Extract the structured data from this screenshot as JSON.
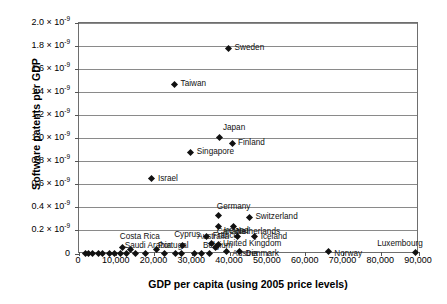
{
  "chart_data": {
    "type": "scatter",
    "title": "",
    "xlabel": "GDP per capita (using 2005 price levels)",
    "ylabel": "Software patents per GDP",
    "xlim": [
      0,
      90000
    ],
    "ylim": [
      0,
      2e-09
    ],
    "grid": true,
    "legend": "none",
    "xticks": [
      0,
      10000,
      20000,
      30000,
      40000,
      50000,
      60000,
      70000,
      80000,
      90000
    ],
    "xtick_labels": [
      "0",
      "10,000",
      "20,000",
      "30,000",
      "40,000",
      "50,000",
      "60,000",
      "70,000",
      "80,000",
      "90,000"
    ],
    "yticks": [
      0,
      2e-10,
      4e-10,
      6e-10,
      8e-10,
      1e-09,
      1.2e-09,
      1.4e-09,
      1.6e-09,
      1.8e-09,
      2e-09
    ],
    "ytick_labels": [
      {
        "mantissa": "0",
        "exponent": ""
      },
      {
        "mantissa": "0.2 × 10",
        "exponent": "-9"
      },
      {
        "mantissa": "0.4 × 10",
        "exponent": "-9"
      },
      {
        "mantissa": "0.6 × 10",
        "exponent": "-9"
      },
      {
        "mantissa": "0.8 × 10",
        "exponent": "-9"
      },
      {
        "mantissa": "1.0 × 10",
        "exponent": "-9"
      },
      {
        "mantissa": "1.2 × 10",
        "exponent": "-9"
      },
      {
        "mantissa": "1.4 × 10",
        "exponent": "-9"
      },
      {
        "mantissa": "1.6 × 10",
        "exponent": "-9"
      },
      {
        "mantissa": "1.8 × 10",
        "exponent": "-9"
      },
      {
        "mantissa": "2.0 × 10",
        "exponent": "-9"
      }
    ],
    "marker": "diamond",
    "marker_color": "#111111",
    "points": [
      {
        "label": "Sweden",
        "x": 39600,
        "y": 1.78e-09,
        "lx": 6,
        "ly": -4
      },
      {
        "label": "Taiwan",
        "x": 25300,
        "y": 1.47e-09,
        "lx": 6,
        "ly": -4
      },
      {
        "label": "Japan",
        "x": 37300,
        "y": 1.01e-09,
        "lx": 3,
        "ly": -13
      },
      {
        "label": "Finland",
        "x": 40500,
        "y": 9.6e-10,
        "lx": 6,
        "ly": -4
      },
      {
        "label": "Singapore",
        "x": 29600,
        "y": 8.8e-10,
        "lx": 6,
        "ly": -4
      },
      {
        "label": "Israel",
        "x": 19300,
        "y": 6.5e-10,
        "lx": 6,
        "ly": -4
      },
      {
        "label": "Germany",
        "x": 37000,
        "y": 3.3e-10,
        "lx": -2,
        "ly": -13
      },
      {
        "label": "Switzerland",
        "x": 45100,
        "y": 3.18e-10,
        "lx": 6,
        "ly": -4
      },
      {
        "label": "Canada",
        "x": 37000,
        "y": 2.4e-10,
        "lx": -2,
        "ly": 2
      },
      {
        "label": "Netherlands",
        "x": 41000,
        "y": 2.4e-10,
        "lx": 2,
        "ly": 2
      },
      {
        "label": "France",
        "x": 33800,
        "y": 1.55e-10,
        "lx": 6,
        "ly": -4
      },
      {
        "label": "Ireland",
        "x": 42000,
        "y": 1.5e-10,
        "lx": -14,
        "ly": -10
      },
      {
        "label": "Iceland",
        "x": 46500,
        "y": 1.5e-10,
        "lx": 6,
        "ly": -4
      },
      {
        "label": "Australia",
        "x": 35000,
        "y": 8.8e-11,
        "lx": -14,
        "ly": -11
      },
      {
        "label": "Cyprus",
        "x": 27300,
        "y": 7e-11,
        "lx": -8,
        "ly": -15
      },
      {
        "label": "United Kingdom",
        "x": 36800,
        "y": 8.5e-11,
        "lx": 5,
        "ly": -4
      },
      {
        "label": "Belgium",
        "x": 36000,
        "y": 5.2e-11,
        "lx": -12,
        "ly": -6
      },
      {
        "label": "Costa Rica",
        "x": 11600,
        "y": 6e-11,
        "lx": -3,
        "ly": -14
      },
      {
        "label": "Saudi Arabia",
        "x": 13700,
        "y": 3.5e-11,
        "lx": -6,
        "ly": -8
      },
      {
        "label": "Portugal",
        "x": 20400,
        "y": 3.5e-11,
        "lx": 2,
        "ly": -8
      },
      {
        "label": "Austria",
        "x": 39000,
        "y": 2e-11,
        "lx": 6,
        "ly": -2
      },
      {
        "label": "Denmark",
        "x": 42500,
        "y": 1.8e-11,
        "lx": 6,
        "ly": -2
      },
      {
        "label": "Norway",
        "x": 66000,
        "y": 1.8e-11,
        "lx": 6,
        "ly": -2
      },
      {
        "label": "Luxembourg",
        "x": 89000,
        "y": 1.5e-11,
        "lx": -38,
        "ly": -12
      },
      {
        "label": "",
        "x": 1600,
        "y": 4e-12,
        "lx": 0,
        "ly": 0
      },
      {
        "label": "",
        "x": 2600,
        "y": 4e-12,
        "lx": 0,
        "ly": 0
      },
      {
        "label": "",
        "x": 3600,
        "y": 4e-12,
        "lx": 0,
        "ly": 0
      },
      {
        "label": "",
        "x": 5100,
        "y": 5e-12,
        "lx": 0,
        "ly": 0
      },
      {
        "label": "",
        "x": 6300,
        "y": 4e-12,
        "lx": 0,
        "ly": 0
      },
      {
        "label": "",
        "x": 8000,
        "y": 6e-12,
        "lx": 0,
        "ly": 0
      },
      {
        "label": "",
        "x": 9400,
        "y": 5e-12,
        "lx": 0,
        "ly": 0
      },
      {
        "label": "",
        "x": 11000,
        "y": 4e-12,
        "lx": 0,
        "ly": 0
      },
      {
        "label": "",
        "x": 12600,
        "y": 4e-12,
        "lx": 0,
        "ly": 0
      },
      {
        "label": "",
        "x": 15000,
        "y": 5e-12,
        "lx": 0,
        "ly": 0
      },
      {
        "label": "",
        "x": 17500,
        "y": 4e-12,
        "lx": 0,
        "ly": 0
      },
      {
        "label": "",
        "x": 22500,
        "y": 4e-12,
        "lx": 0,
        "ly": 0
      },
      {
        "label": "",
        "x": 25500,
        "y": 5e-12,
        "lx": 0,
        "ly": 0
      },
      {
        "label": "",
        "x": 27200,
        "y": 4e-12,
        "lx": 0,
        "ly": 0
      },
      {
        "label": "",
        "x": 30600,
        "y": 6e-12,
        "lx": 0,
        "ly": 0
      },
      {
        "label": "",
        "x": 32300,
        "y": 5e-12,
        "lx": 0,
        "ly": 0
      },
      {
        "label": "",
        "x": 34600,
        "y": 4e-12,
        "lx": 0,
        "ly": 0
      }
    ]
  }
}
